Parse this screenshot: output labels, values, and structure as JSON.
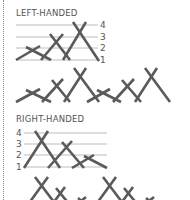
{
  "sections": [
    {
      "title": "LEFT-HANDED",
      "gridlines": [
        "4",
        "3",
        "2",
        "1"
      ],
      "label_side": "right"
    },
    {
      "title": "RIGHT-HANDED",
      "gridlines": [
        "4",
        "3",
        "2",
        "1"
      ],
      "label_side": "left"
    }
  ],
  "colors": {
    "stroke": "#5a5a5a",
    "grid": "#bdbdbd",
    "text": "#555555"
  }
}
